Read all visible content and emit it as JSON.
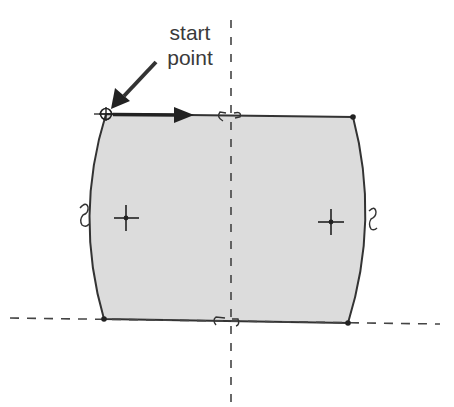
{
  "annotation": {
    "line1": "start",
    "line2": "point"
  },
  "diagram": {
    "type": "sketch-profile",
    "fill_color": "#dcdcdc",
    "edge_color": "#333333",
    "axis_color": "#444444",
    "vertices": [
      {
        "name": "top-left",
        "x": 106,
        "y": 114
      },
      {
        "name": "top-right",
        "x": 353,
        "y": 117
      },
      {
        "name": "bottom-right",
        "x": 348,
        "y": 323
      },
      {
        "name": "bottom-left",
        "x": 104,
        "y": 319
      }
    ],
    "arc_centers": [
      {
        "name": "left-arc-center",
        "x": 126,
        "y": 218
      },
      {
        "name": "right-arc-center",
        "x": 331,
        "y": 222
      }
    ],
    "constraint_markers": [
      "top-edge-midpoint",
      "bottom-edge-midpoint",
      "left-arc-tangent",
      "right-arc-tangent"
    ]
  },
  "cutoff_text": ""
}
